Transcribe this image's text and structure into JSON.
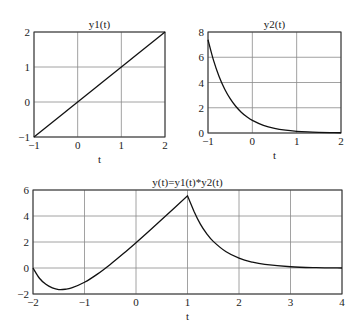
{
  "chart_data": [
    {
      "type": "line",
      "title": "y1(t)",
      "xlabel": "t",
      "ylabel": "",
      "xlim": [
        -1,
        2
      ],
      "ylim": [
        -1,
        2
      ],
      "xticks": [
        -1,
        0,
        1,
        2
      ],
      "yticks": [
        -1,
        0,
        1,
        2
      ],
      "grid": true,
      "x": [
        -1,
        2
      ],
      "values": [
        -1,
        2
      ],
      "frame": {
        "left": 34,
        "top": 32,
        "right": 165,
        "bottom": 137
      }
    },
    {
      "type": "line",
      "title": "y2(t)",
      "xlabel": "t",
      "ylabel": "",
      "xlim": [
        -1,
        2
      ],
      "ylim": [
        0,
        8
      ],
      "xticks": [
        -1,
        0,
        1,
        2
      ],
      "yticks": [
        0,
        2,
        4,
        6,
        8
      ],
      "grid": true,
      "x": [
        -1,
        -0.875,
        -0.75,
        -0.625,
        -0.5,
        -0.375,
        -0.25,
        -0.125,
        0,
        0.25,
        0.5,
        0.75,
        1,
        1.25,
        1.5,
        1.75,
        2
      ],
      "values": [
        7.389,
        5.755,
        4.482,
        3.49,
        2.718,
        2.117,
        1.649,
        1.284,
        1,
        0.607,
        0.368,
        0.223,
        0.135,
        0.082,
        0.05,
        0.03,
        0.018
      ],
      "frame": {
        "left": 208,
        "top": 32,
        "right": 341,
        "bottom": 133
      }
    },
    {
      "type": "line",
      "title": "y(t)=y1(t)*y2(t)",
      "xlabel": "t",
      "ylabel": "",
      "xlim": [
        -2,
        4
      ],
      "ylim": [
        -2,
        6
      ],
      "xticks": [
        -2,
        -1,
        0,
        1,
        2,
        3,
        4
      ],
      "yticks": [
        -2,
        0,
        2,
        4,
        6
      ],
      "grid": true,
      "x": [
        -2,
        -1.875,
        -1.75,
        -1.625,
        -1.5,
        -1.375,
        -1.25,
        -1,
        -0.75,
        -0.5,
        -0.25,
        0,
        0.25,
        0.5,
        0.75,
        1,
        1.125,
        1.25,
        1.375,
        1.5,
        1.75,
        2,
        2.25,
        2.5,
        3,
        3.5,
        4
      ],
      "values": [
        0,
        -0.787,
        -1.257,
        -1.527,
        -1.656,
        -1.636,
        -1.534,
        -1.097,
        -0.469,
        0.276,
        1.091,
        1.949,
        2.833,
        3.732,
        4.641,
        5.556,
        4.37,
        3.377,
        2.628,
        2.048,
        1.244,
        0.755,
        0.459,
        0.276,
        0.097,
        0.028,
        0
      ],
      "frame": {
        "left": 33,
        "top": 190,
        "right": 342,
        "bottom": 294
      }
    }
  ]
}
